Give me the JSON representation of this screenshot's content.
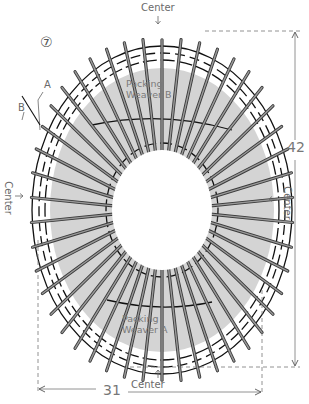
{
  "figure": {
    "step_number": "⑦",
    "labels": {
      "center_top": "Center",
      "center_bottom": "Center",
      "center_left": "Center",
      "center_right": "Center",
      "weaver_a_marker": "A",
      "weaver_b_marker": "B",
      "packing_top_line1": "Packing",
      "packing_top_line2": "Weaver B",
      "packing_bottom_line1": "Packing",
      "packing_bottom_line2": "Weaver A"
    },
    "dimensions": {
      "height": "42",
      "width": "31"
    },
    "colors": {
      "spoke": "#3a3a3a",
      "spoke_fill": "#9a9a9a",
      "weaver": "#111111",
      "packing_shade": "#d4d4d4",
      "dim_line": "#777777",
      "label": "#6a6a6a"
    },
    "geometry": {
      "cx": 162,
      "cy": 210,
      "inner_rx": 50,
      "inner_ry": 60,
      "outer_rx": 140,
      "outer_ry": 183,
      "spoke_count": 46
    },
    "icons": {
      "arrow_down": "↓",
      "arrow_up": "↑",
      "arrow_right": "→",
      "arrow_left": "←"
    }
  }
}
